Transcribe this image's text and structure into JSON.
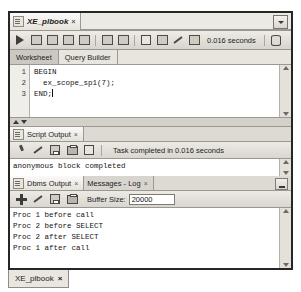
{
  "window": {
    "editor_tab": {
      "label": "XE_plbook",
      "close": "×",
      "icon": "worksheet-icon"
    },
    "tabstrip_dropdown_icon": "chevron-down-icon"
  },
  "toolbar": {
    "buttons": [
      {
        "name": "run-statement-button",
        "icon": "play-icon"
      },
      {
        "name": "run-script-button",
        "icon": "script-run-icon"
      },
      {
        "name": "commit-button",
        "icon": "commit-icon"
      },
      {
        "name": "rollback-button",
        "icon": "rollback-icon"
      },
      {
        "name": "unshared-sql-worksheet-button",
        "icon": "magnifier-icon"
      },
      {
        "name": "cancel-button",
        "icon": "cancel-icon"
      },
      {
        "name": "sql-history-button",
        "icon": "history-icon"
      },
      {
        "name": "explain-plan-button",
        "icon": "grid-icon"
      },
      {
        "name": "autotrace-button",
        "icon": "autotrace-icon"
      },
      {
        "name": "clear-button",
        "icon": "eraser-icon"
      },
      {
        "name": "query-builder-button",
        "icon": "query-builder-icon"
      }
    ],
    "timing": "0.016 seconds",
    "connection_icon": "database-icon"
  },
  "worksheet": {
    "tabs": [
      {
        "label": "Worksheet",
        "active": true
      },
      {
        "label": "Query Builder",
        "active": false
      }
    ],
    "line_numbers": [
      "1",
      "2",
      "3"
    ],
    "code_lines": [
      "BEGIN",
      "  ex_scope_sp1(7);",
      "END;"
    ],
    "scroll_up_icon": "scroll-up-arrow",
    "scroll_down_icon": "scroll-down-arrow"
  },
  "script_output": {
    "tabs": [
      {
        "label": "Script Output",
        "close": "×",
        "active": true
      }
    ],
    "toolbar": [
      {
        "name": "pin-button",
        "icon": "pin-icon"
      },
      {
        "name": "clear-button",
        "icon": "eraser-icon"
      },
      {
        "name": "save-button",
        "icon": "disk-icon"
      },
      {
        "name": "print-button",
        "icon": "printer-icon"
      },
      {
        "name": "grid-button",
        "icon": "grid-icon"
      }
    ],
    "status": "Task completed in 0.016 seconds",
    "lines": [
      "anonymous block completed"
    ]
  },
  "dbms_output": {
    "tabs": [
      {
        "label": "Dbms Output",
        "close": "×",
        "active": true
      },
      {
        "label": "Messages - Log",
        "close": "×",
        "active": false
      }
    ],
    "minimize_icon": "minimize-icon",
    "toolbar": [
      {
        "name": "enable-output-button",
        "icon": "plus-icon"
      },
      {
        "name": "clear-button",
        "icon": "eraser-icon"
      },
      {
        "name": "save-button",
        "icon": "disk-icon"
      },
      {
        "name": "print-button",
        "icon": "printer-icon"
      }
    ],
    "buffer_label": "Buffer Size:",
    "buffer_value": "20000",
    "lines": [
      "Proc 1 before call",
      "Proc 2 before SELECT",
      "Proc 2 after SELECT",
      "Proc 1 after call"
    ]
  },
  "bottom": {
    "tab_label": "XE_plbook",
    "tab_close": "×"
  },
  "colors": {
    "panel_bg": "#d6d3cd",
    "border": "#262626",
    "editor_bg": "#ffffff",
    "text": "#141414"
  }
}
